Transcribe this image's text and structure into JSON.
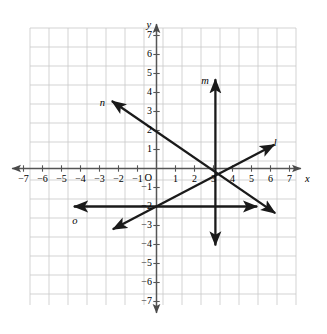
{
  "chart_data": {
    "type": "line",
    "title": "",
    "xlabel": "x",
    "ylabel": "y",
    "xlim": [
      -7.6,
      7.6
    ],
    "ylim": [
      -7.6,
      7.6
    ],
    "grid": true,
    "grid_color": "#c8c8c8",
    "axis_color": "#555555",
    "line_color": "#1a1a1a",
    "background": "#ffffff",
    "origin_label": "O",
    "x_ticks": [
      -7,
      -6,
      -5,
      -4,
      -3,
      -2,
      -1,
      1,
      2,
      3,
      4,
      5,
      6,
      7
    ],
    "y_ticks": [
      7,
      6,
      5,
      4,
      3,
      2,
      1,
      -1,
      -2,
      -3,
      -4,
      -5,
      -6,
      -7
    ],
    "x_tick_labels": [
      "−7",
      "−6",
      "−5",
      "−4",
      "−3",
      "−2",
      "−1",
      "1",
      "2",
      "3",
      "4",
      "5",
      "6",
      "7"
    ],
    "y_tick_labels": [
      "7",
      "6",
      "5",
      "4",
      "3",
      "2",
      "1",
      "−1",
      "−2",
      "−3",
      "−4",
      "−5",
      "−6",
      "−7"
    ],
    "legend_position": "none",
    "series": [
      {
        "name": "m",
        "label": "m",
        "description": "vertical line through x = 3.1, double-headed arrow",
        "x": [
          3.1,
          3.1
        ],
        "y": [
          -4.05,
          4.7
        ],
        "label_x": 2.55,
        "label_y": 4.85,
        "arrows": "both"
      },
      {
        "name": "n",
        "label": "n",
        "description": "line with negative slope through (0, 2) and (3.1, 0), double-headed arrow",
        "x": [
          -2.35,
          6.25
        ],
        "y": [
          3.55,
          -2.35
        ],
        "label_x": -2.85,
        "label_y": 3.7,
        "arrows": "both"
      },
      {
        "name": "l",
        "label": "l",
        "description": "line with positive slope through (0, -2) and (3.45, 0), double-headed arrow",
        "x": [
          -2.3,
          6.2
        ],
        "y": [
          -3.2,
          1.25
        ],
        "label_x": 6.25,
        "label_y": 1.6,
        "arrows": "both"
      },
      {
        "name": "o",
        "label": "o",
        "description": "horizontal line at y = -2, double-headed arrow",
        "x": [
          -4.35,
          5.3
        ],
        "y": [
          -2.0,
          -2.0
        ],
        "label_x": -4.3,
        "label_y": -2.5,
        "arrows": "both"
      }
    ]
  }
}
